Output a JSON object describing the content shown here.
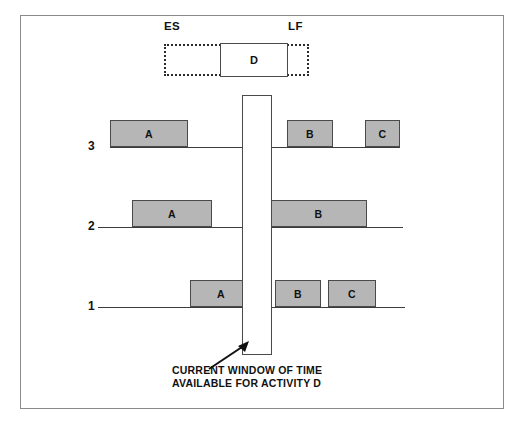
{
  "figure": {
    "title_caption_lines": [
      "CURRENT WINDOW OF TIME",
      "AVAILABLE FOR ACTIVITY D"
    ],
    "background_color": "#ffffff",
    "frame_color": "#8a8a8a"
  },
  "float_bar": {
    "es_label": "ES",
    "lf_label": "LF",
    "activity_label": "D",
    "dashed_border_color": "#2b2b2b",
    "box_border_color": "#4a4a4a"
  },
  "time_window": {
    "name": "current-window-of-time",
    "fill": "#ffffff",
    "border_color": "#4a4a4a"
  },
  "arrow": {
    "name": "caption-pointer-arrow",
    "color": "#111111"
  },
  "bar_style": {
    "fill": "#b6b6b6",
    "border": "#4a4a4a"
  },
  "chart_data": {
    "type": "bar",
    "xlabel": "",
    "ylabel": "",
    "orientation": "horizontal-timeline",
    "grid": false,
    "legend": null,
    "rows": [
      {
        "label": "3",
        "label_x": 88,
        "baseline_y": 147,
        "baseline_x": 110,
        "baseline_width": 290,
        "bars": [
          {
            "label": "A",
            "x": 110,
            "width": 78,
            "height": 27
          },
          {
            "label": "B",
            "x": 287,
            "width": 46,
            "height": 27
          },
          {
            "label": "C",
            "x": 365,
            "width": 35,
            "height": 27
          }
        ]
      },
      {
        "label": "2",
        "label_x": 88,
        "baseline_y": 227,
        "baseline_x": 98,
        "baseline_width": 305,
        "bars": [
          {
            "label": "A",
            "x": 132,
            "width": 80,
            "height": 27
          },
          {
            "label": "B",
            "x": 270,
            "width": 97,
            "height": 27
          }
        ]
      },
      {
        "label": "1",
        "label_x": 88,
        "baseline_y": 307,
        "baseline_x": 98,
        "baseline_width": 307,
        "bars": [
          {
            "label": "A",
            "x": 190,
            "width": 62,
            "height": 27
          },
          {
            "label": "B",
            "x": 275,
            "width": 46,
            "height": 27
          },
          {
            "label": "C",
            "x": 328,
            "width": 48,
            "height": 27
          }
        ]
      }
    ],
    "float_range": {
      "es": "ES",
      "lf": "LF",
      "activity": "D"
    }
  }
}
